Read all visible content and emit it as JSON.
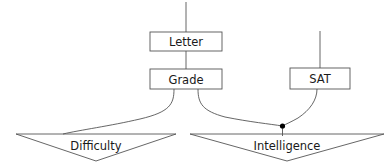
{
  "diagram": {
    "canvas": {
      "width": 389,
      "height": 165
    },
    "colors": {
      "background": "#ffffff",
      "stroke": "#555555",
      "text": "#1a1a1a",
      "junction": "#000000"
    },
    "nodes": [
      {
        "id": "letter",
        "label": "Letter",
        "shape": "rectangle",
        "x": 150,
        "y": 32,
        "width": 72,
        "height": 19,
        "center_x": 186,
        "center_y": 41.5
      },
      {
        "id": "grade",
        "label": "Grade",
        "shape": "rectangle",
        "x": 150,
        "y": 69,
        "width": 72,
        "height": 20,
        "center_x": 186,
        "center_y": 79
      },
      {
        "id": "sat",
        "label": "SAT",
        "shape": "rectangle",
        "x": 290,
        "y": 68,
        "width": 60,
        "height": 21,
        "center_x": 320,
        "center_y": 78.5
      },
      {
        "id": "difficulty",
        "label": "Difficulty",
        "shape": "chevron",
        "left_x": 16,
        "right_x": 176,
        "top_y": 134,
        "apex_x": 96,
        "apex_y": 161,
        "center_x": 96,
        "center_y": 145
      },
      {
        "id": "intelligence",
        "label": "Intelligence",
        "shape": "chevron",
        "left_x": 190,
        "right_x": 384,
        "top_y": 134,
        "apex_x": 287,
        "apex_y": 161,
        "center_x": 287,
        "center_y": 145
      }
    ],
    "edges": [
      {
        "id": "stub-above-letter",
        "from": "top",
        "to": "letter",
        "type": "straight"
      },
      {
        "id": "letter-to-grade",
        "from": "letter",
        "to": "grade",
        "type": "straight"
      },
      {
        "id": "stub-above-sat",
        "from": "top",
        "to": "sat",
        "type": "straight"
      },
      {
        "id": "grade-to-difficulty",
        "from": "grade",
        "to": "difficulty",
        "type": "curve"
      },
      {
        "id": "grade-to-junction",
        "from": "grade",
        "to": "junction",
        "type": "curve"
      },
      {
        "id": "sat-to-junction",
        "from": "sat",
        "to": "junction",
        "type": "curve"
      },
      {
        "id": "junction-to-intelligence",
        "from": "junction",
        "to": "intelligence",
        "type": "straight"
      }
    ],
    "junction": {
      "id": "intelligence-junction",
      "x": 282.5,
      "y": 126,
      "radius": 2.6
    }
  }
}
